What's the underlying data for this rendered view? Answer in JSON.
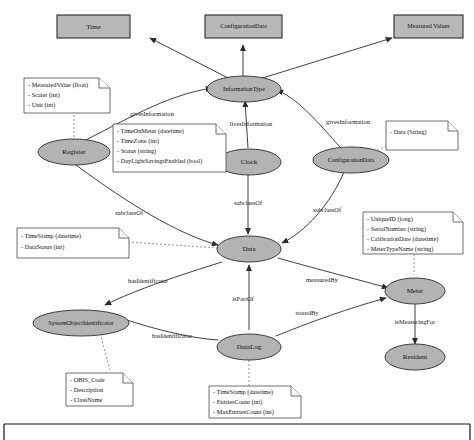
{
  "diagram": {
    "colors": {
      "node_fill": "#b3b3b3",
      "rect_fill": "#b8b8b8",
      "stroke": "#2b2b2b",
      "note_fill": "#ffffff",
      "note_stroke": "#4a4a4a",
      "link_stroke": "#777777",
      "text": "#111111",
      "background": "#ffffff"
    },
    "top_boxes": [
      {
        "id": "time",
        "label": "Time"
      },
      {
        "id": "configuration_data_box",
        "label": "ConfigurationData"
      },
      {
        "id": "measured_values",
        "label": "Measured Values"
      }
    ],
    "ellipses": [
      {
        "id": "information_type",
        "label": "InformationType"
      },
      {
        "id": "register",
        "label": "Register"
      },
      {
        "id": "clock",
        "label": "Clock"
      },
      {
        "id": "configuration_data",
        "label": "ConfigurationData"
      },
      {
        "id": "data",
        "label": "Data"
      },
      {
        "id": "system_object_identificator",
        "label": "SystemObjectIdentificator"
      },
      {
        "id": "data_log",
        "label": "DataLog"
      },
      {
        "id": "meter",
        "label": "Meter"
      },
      {
        "id": "resident",
        "label": "Resident"
      }
    ],
    "notes": [
      {
        "id": "register-note",
        "lines": [
          "- MeasuredValue (float)",
          "- Scaler (int)",
          "- Unit (int)"
        ]
      },
      {
        "id": "clock-note",
        "lines": [
          "- TimeOnMeter (datetime)",
          "- TimeZone (int)",
          "- Status (string)",
          "- DayLightSavingsEnabled (bool)"
        ]
      },
      {
        "id": "configuration-data-note",
        "lines": [
          "- Data (String)"
        ]
      },
      {
        "id": "data-note",
        "lines": [
          "- TimeStamp (datetime)",
          "- DataStatus (int)"
        ]
      },
      {
        "id": "meter-note",
        "lines": [
          "- UniqueID (long)",
          "- SerialNumber (string)",
          "- CalibrationDate (datetime)",
          "- MeterTypeName (string)"
        ]
      },
      {
        "id": "system-object-identificator-note",
        "lines": [
          "- OBIS_Code",
          "- Description",
          "- ClassName"
        ]
      },
      {
        "id": "data-log-note",
        "lines": [
          "- TimeStamp (datetime)",
          "- EntriesCount (int)",
          "- MaxEntriesCount (int)"
        ]
      }
    ],
    "edge_labels": [
      {
        "id": "register-gives-information",
        "label": "givesInformation"
      },
      {
        "id": "clock-gives-information",
        "label": "livesInformation"
      },
      {
        "id": "configuration-gives-information",
        "label": "givesInformation"
      },
      {
        "id": "register-subclass-of",
        "label": "subclassOf"
      },
      {
        "id": "clock-subclass-of",
        "label": "subclassOf"
      },
      {
        "id": "configuration-subclass-of",
        "label": "subclassOf"
      },
      {
        "id": "data-has-identificator",
        "label": "hasIdentificator"
      },
      {
        "id": "data-measured-by",
        "label": "measuredBy"
      },
      {
        "id": "data-is-part-of",
        "label": "isPartOf"
      },
      {
        "id": "data-log-stored-by",
        "label": "storedBy"
      },
      {
        "id": "data-log-has-identificator",
        "label": "hasIdentificator"
      },
      {
        "id": "meter-is-measuring-for",
        "label": "isMeasuringFor"
      }
    ]
  }
}
